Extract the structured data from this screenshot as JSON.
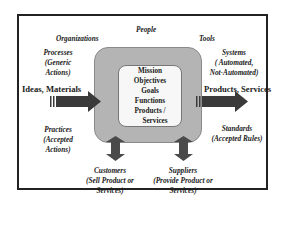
{
  "diagram": {
    "outer_labels": {
      "people": "People",
      "organizations": "Organizations",
      "tools": "Tools"
    },
    "left_side": {
      "processes": [
        "Processes",
        "(Generic",
        "Actions)"
      ],
      "input": "Ideas, Materials",
      "practices": [
        "Practices",
        "(Accepted",
        "Actions)"
      ]
    },
    "right_side": {
      "systems": [
        "Systems",
        "( Automated,",
        "Not-Automated)"
      ],
      "output": "Products, Services",
      "standards": [
        "Standards",
        "(Accepted Rules)"
      ]
    },
    "bottom": {
      "customers": [
        "Customers",
        "(Sell Product or",
        "Services)"
      ],
      "suppliers": [
        "Suppliers",
        "(Provide Product or",
        "Services)"
      ]
    },
    "core": {
      "items": [
        "Mission",
        "Objectives",
        "Goals",
        "Functions",
        "Products /",
        "Services"
      ]
    },
    "colors": {
      "border": "#222222",
      "gray_box": "#b4b4b4",
      "inner_box": "#f7f7f7",
      "arrow": "#3a3a3a"
    }
  }
}
